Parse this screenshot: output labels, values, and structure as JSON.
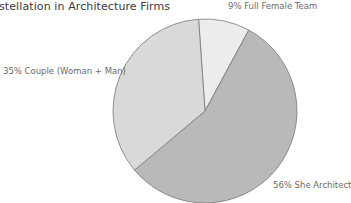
{
  "chart_data": {
    "type": "pie",
    "title": "stellation in Architecture Firms",
    "categories": [
      "Full Female Team",
      "She Architect",
      "Couple (Woman + Man)"
    ],
    "values": [
      9,
      56,
      35
    ],
    "unit": "%",
    "labels": [
      "9% Full Female Team",
      "56% She Architect",
      "35% Couple (Woman + Man)"
    ],
    "colors": [
      "#ececec",
      "#b9b9b9",
      "#d9d9d9"
    ],
    "start_angle_deg": -4,
    "direction": "clockwise",
    "legend": "none (direct labels)"
  },
  "labels": {
    "full_female": "9% Full Female Team",
    "she_architect": "56% She Architect",
    "couple": "35% Couple (Woman + Man)"
  }
}
